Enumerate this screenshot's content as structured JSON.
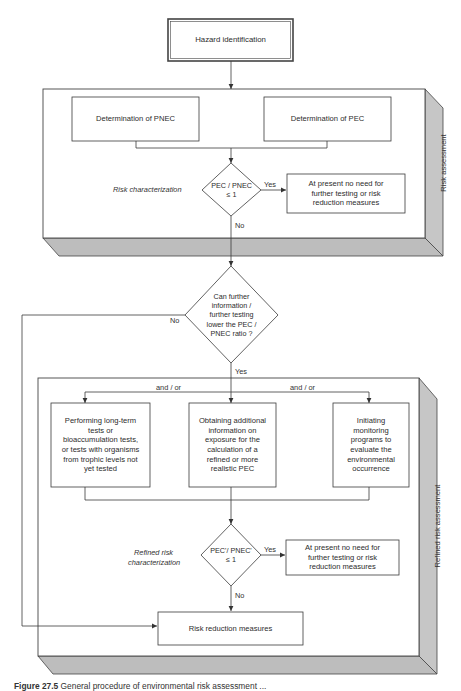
{
  "diagram": {
    "hazard_box": "Hazard identification",
    "risk_assessment": {
      "side_label": "Risk assessment",
      "pnec_box": "Determination of PNEC",
      "pec_box": "Determination of PEC",
      "characterization_label": "Risk characterization",
      "decision": {
        "line1": "PEC / PNEC",
        "line2": "≤ 1"
      },
      "yes_label": "Yes",
      "yes_box": "At present no need for further testing or risk reduction measures",
      "no_label": "No"
    },
    "further_testing_decision": {
      "text": "Can further information / further testing lower the PEC / PNEC ratio ?",
      "no_label": "No",
      "yes_label": "Yes"
    },
    "refined_risk_assessment": {
      "side_label": "Refined risk assessment",
      "and_or_1": "and / or",
      "and_or_2": "and / or",
      "option_1": "Performing long-term tests or bioaccumulation tests, or tests with organisms from trophic levels not yet tested",
      "option_2": "Obtaining additional information on exposure for the calculation of a refined or more realistic PEC",
      "option_3": "Initiating monitoring programs to evaluate the environmental occurrence",
      "characterization_label_1": "Refined risk",
      "characterization_label_2": "characterization",
      "decision": {
        "line1": "PEC'/ PNEC'",
        "line2": "≤ 1"
      },
      "yes_label": "Yes",
      "yes_box": "At present no need for further testing or risk reduction measures",
      "no_label": "No"
    },
    "final_box": "Risk reduction measures",
    "caption": {
      "prefix": "Figure 27.5",
      "text": " General procedure of environmental risk assessment ..."
    }
  },
  "colors": {
    "line": "#3a3a3a",
    "panel_shade": "#c4c4c4",
    "panel_shade_dark": "#b3b3b3"
  }
}
